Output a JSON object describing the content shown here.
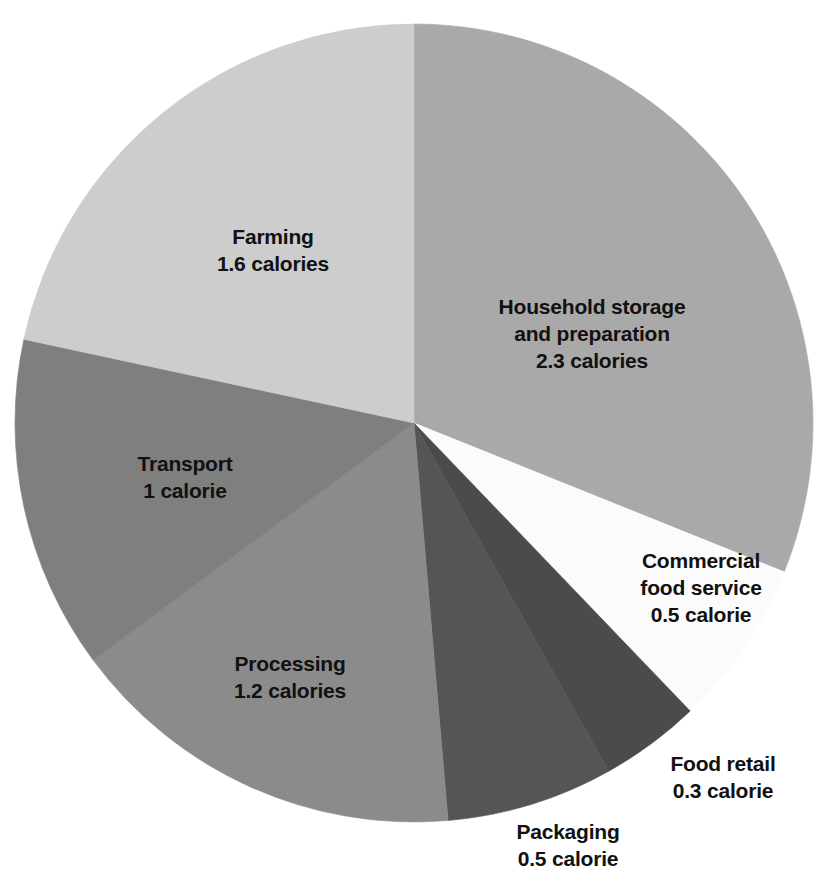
{
  "chart_data": {
    "type": "pie",
    "title": "",
    "subtitle": "",
    "xlabel": "",
    "ylabel": "",
    "unit": "calories",
    "total": 7.4,
    "legend_position": "none",
    "grid": false,
    "labels_inside": true,
    "start_angle_deg": 0,
    "direction": "clockwise",
    "categories": [
      "Household storage and preparation",
      "Commercial food service",
      "Food retail",
      "Packaging",
      "Processing",
      "Transport",
      "Farming"
    ],
    "values": [
      2.3,
      0.5,
      0.3,
      0.5,
      1.2,
      1.0,
      1.6
    ],
    "colors": [
      "#a9a9a9",
      "#fbfbfb",
      "#4b4b4b",
      "#555555",
      "#8b8b8b",
      "#7f7f7f",
      "#cdcdcd"
    ],
    "slices": [
      {
        "name": "Household storage and preparation",
        "label_line1": "Household storage",
        "label_line2": "and preparation",
        "value": 2.3,
        "value_text": "2.3 calories",
        "color": "#a9a9a9",
        "start_deg": 0,
        "sweep_deg": 111.9,
        "label_x": 592,
        "label_y": 334,
        "label_color": "#111111",
        "label_lines": 2
      },
      {
        "name": "Commercial food service",
        "label_line1": "Commercial",
        "label_line2": "food service",
        "value": 0.5,
        "value_text": "0.5 calorie",
        "color": "#fbfbfb",
        "start_deg": 111.9,
        "sweep_deg": 24.3,
        "label_x": 701,
        "label_y": 588,
        "label_color": "#111111",
        "label_lines": 2
      },
      {
        "name": "Food retail",
        "label_line1": "Food retail",
        "label_line2": "",
        "value": 0.3,
        "value_text": "0.3 calorie",
        "color": "#4b4b4b",
        "start_deg": 136.2,
        "sweep_deg": 14.6,
        "label_x": 723,
        "label_y": 778,
        "label_color": "#111111",
        "label_lines": 1
      },
      {
        "name": "Packaging",
        "label_line1": "Packaging",
        "label_line2": "",
        "value": 0.5,
        "value_text": "0.5 calorie",
        "color": "#555555",
        "start_deg": 150.8,
        "sweep_deg": 24.3,
        "label_x": 568,
        "label_y": 846,
        "label_color": "#111111",
        "label_lines": 1
      },
      {
        "name": "Processing",
        "label_line1": "Processing",
        "label_line2": "",
        "value": 1.2,
        "value_text": "1.2 calories",
        "color": "#8b8b8b",
        "start_deg": 175.1,
        "sweep_deg": 58.4,
        "label_x": 290,
        "label_y": 678,
        "label_color": "#111111",
        "label_lines": 1
      },
      {
        "name": "Transport",
        "label_line1": "Transport",
        "label_line2": "",
        "value": 1.0,
        "value_text": "1 calorie",
        "color": "#7f7f7f",
        "start_deg": 233.5,
        "sweep_deg": 48.6,
        "label_x": 185,
        "label_y": 478,
        "label_color": "#111111",
        "label_lines": 1
      },
      {
        "name": "Farming",
        "label_line1": "Farming",
        "label_line2": "",
        "value": 1.6,
        "value_text": "1.6 calories",
        "color": "#cdcdcd",
        "start_deg": 282.1,
        "sweep_deg": 77.9,
        "label_x": 273,
        "label_y": 251,
        "label_color": "#111111",
        "label_lines": 1
      }
    ],
    "geometry": {
      "center_x": 414,
      "center_y": 423,
      "radius": 399
    },
    "background_color": "#ffffff"
  }
}
